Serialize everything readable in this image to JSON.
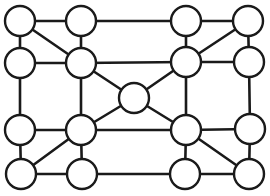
{
  "diagram": {
    "type": "graph",
    "directed": false,
    "node_radius": 15,
    "colors": {
      "stroke": "#1a1a1a",
      "fill": "#ffffff",
      "background": "#ffffff"
    },
    "nodes": [
      {
        "id": "a1",
        "x": 20,
        "y": 21
      },
      {
        "id": "a2",
        "x": 81,
        "y": 21
      },
      {
        "id": "a3",
        "x": 186,
        "y": 21
      },
      {
        "id": "a4",
        "x": 248,
        "y": 21
      },
      {
        "id": "b1",
        "x": 20,
        "y": 63
      },
      {
        "id": "b2",
        "x": 81,
        "y": 63
      },
      {
        "id": "b3",
        "x": 186,
        "y": 62
      },
      {
        "id": "b4",
        "x": 249,
        "y": 62
      },
      {
        "id": "c",
        "x": 134,
        "y": 98
      },
      {
        "id": "c1",
        "x": 20,
        "y": 130
      },
      {
        "id": "c2",
        "x": 81,
        "y": 130
      },
      {
        "id": "c3",
        "x": 186,
        "y": 130
      },
      {
        "id": "c4",
        "x": 250,
        "y": 129
      },
      {
        "id": "d1",
        "x": 21,
        "y": 174
      },
      {
        "id": "d2",
        "x": 82,
        "y": 174
      },
      {
        "id": "d3",
        "x": 185,
        "y": 174
      },
      {
        "id": "d4",
        "x": 249,
        "y": 174
      }
    ],
    "edges": [
      [
        "a1",
        "a2"
      ],
      [
        "a2",
        "a3"
      ],
      [
        "a3",
        "a4"
      ],
      [
        "a1",
        "b1"
      ],
      [
        "a1",
        "b2"
      ],
      [
        "a2",
        "b2"
      ],
      [
        "a3",
        "b3"
      ],
      [
        "a4",
        "b3"
      ],
      [
        "a4",
        "b4"
      ],
      [
        "b1",
        "b2"
      ],
      [
        "b2",
        "b3"
      ],
      [
        "b3",
        "b4"
      ],
      [
        "b2",
        "c"
      ],
      [
        "b3",
        "c"
      ],
      [
        "b1",
        "c1"
      ],
      [
        "b2",
        "c2"
      ],
      [
        "b3",
        "c3"
      ],
      [
        "b4",
        "c4"
      ],
      [
        "c",
        "c2"
      ],
      [
        "c",
        "c3"
      ],
      [
        "c1",
        "c2"
      ],
      [
        "c2",
        "c3"
      ],
      [
        "c3",
        "c4"
      ],
      [
        "c1",
        "d1"
      ],
      [
        "c2",
        "d1"
      ],
      [
        "c2",
        "d2"
      ],
      [
        "c3",
        "d3"
      ],
      [
        "c3",
        "d4"
      ],
      [
        "c4",
        "d4"
      ],
      [
        "d1",
        "d2"
      ],
      [
        "d2",
        "d3"
      ],
      [
        "d3",
        "d4"
      ]
    ]
  }
}
